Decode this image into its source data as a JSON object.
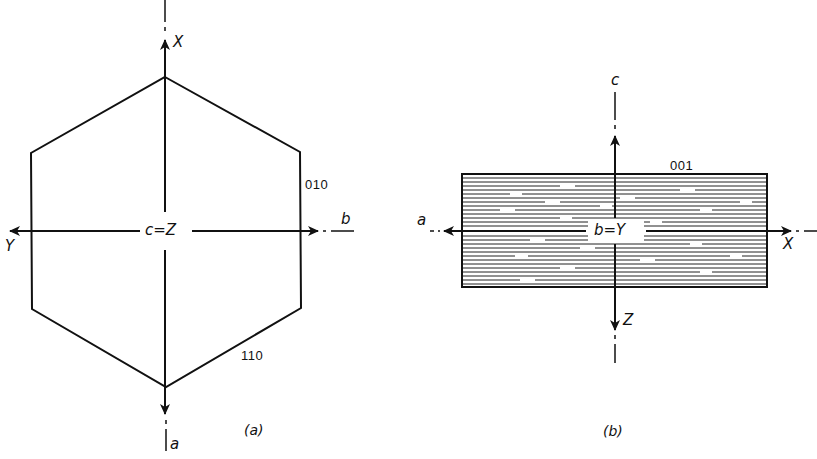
{
  "figure": {
    "panel_a": {
      "caption": "(a)",
      "axes": {
        "vertical_up": "X",
        "vertical_down": "a",
        "horizontal_left": "Y",
        "horizontal_right": "b",
        "center": "c=Z"
      },
      "faces": {
        "right_vertical": "010",
        "lower_right": "110"
      },
      "shape": "hexagon"
    },
    "panel_b": {
      "caption": "(b)",
      "axes": {
        "vertical_up": "c",
        "vertical_down": "Z",
        "horizontal_left": "a",
        "horizontal_right": "X",
        "center": "b=Y"
      },
      "faces": {
        "top": "001"
      },
      "shape": "rectangle with horizontal cleavage hatching"
    },
    "colors": {
      "ink": "#111111",
      "background": "#ffffff"
    }
  }
}
